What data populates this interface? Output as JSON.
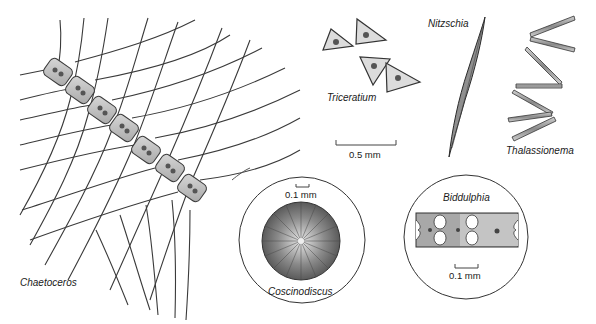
{
  "figure": {
    "background": "#ffffff",
    "ink_color": "#2a2a2a"
  },
  "specimens": {
    "chaetoceros": {
      "label": "Chaetoceros"
    },
    "triceratium": {
      "label": "Triceratium"
    },
    "nitzschia": {
      "label": "Nitzschia"
    },
    "thalassionema": {
      "label": "Thalassionema"
    },
    "coscinodiscus": {
      "label": "Coscinodiscus",
      "scale_label": "0.1 mm"
    },
    "biddulphia": {
      "label": "Biddulphia",
      "scale_label": "0.1 mm"
    }
  },
  "scale_bars": {
    "main": {
      "label": "0.5 mm"
    }
  }
}
